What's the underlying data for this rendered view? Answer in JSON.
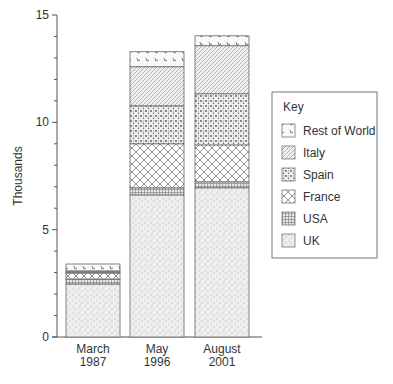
{
  "chart_data": {
    "type": "bar",
    "stacked": true,
    "title": "",
    "xlabel": "",
    "ylabel": "Thousands",
    "ylim": [
      0,
      15
    ],
    "yticks": [
      "0",
      "5",
      "10",
      "15"
    ],
    "minor_tick_step": 1,
    "grid": false,
    "categories": [
      {
        "line1": "March",
        "line2": "1987"
      },
      {
        "line1": "May",
        "line2": "1996"
      },
      {
        "line1": "August",
        "line2": "2001"
      }
    ],
    "series": [
      {
        "name": "UK",
        "pattern": "stipple",
        "values": [
          2.47,
          6.62,
          6.95
        ]
      },
      {
        "name": "USA",
        "pattern": "grid",
        "values": [
          0.23,
          0.33,
          0.28
        ]
      },
      {
        "name": "France",
        "pattern": "crosshatch",
        "values": [
          0.28,
          2.05,
          1.72
        ]
      },
      {
        "name": "Spain",
        "pattern": "dots",
        "values": [
          0.05,
          1.77,
          2.38
        ]
      },
      {
        "name": "Italy",
        "pattern": "diagonal",
        "values": [
          0.05,
          1.82,
          2.24
        ]
      },
      {
        "name": "Rest of World",
        "pattern": "ticks",
        "values": [
          0.32,
          0.7,
          0.46
        ]
      }
    ],
    "legend": {
      "title": "Key",
      "position": "right",
      "order": [
        "Rest of World",
        "Italy",
        "Spain",
        "France",
        "USA",
        "UK"
      ]
    }
  }
}
